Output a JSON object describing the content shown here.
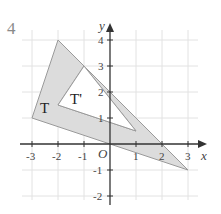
{
  "question_number": "4",
  "axes": {
    "x_label": "x",
    "y_label": "y",
    "origin_label": "O",
    "x_ticks": [
      "-3",
      "-2",
      "-1",
      "1",
      "2",
      "3"
    ],
    "y_ticks": [
      "4",
      "3",
      "2",
      "1",
      "-1",
      "-2"
    ]
  },
  "shapes": {
    "outer_triangle": {
      "label": "T",
      "vertices": [
        [
          -2,
          4
        ],
        [
          -3,
          1
        ],
        [
          3,
          -1
        ]
      ]
    },
    "inner_triangle": {
      "label": "T'",
      "vertices": [
        [
          -1,
          3
        ],
        [
          -2,
          1.5
        ],
        [
          1,
          0.5
        ]
      ]
    }
  },
  "colors": {
    "fill": "#dcdcdc",
    "stroke": "#9a9a9a",
    "grid": "#e2e2e2",
    "axis": "#333333"
  }
}
